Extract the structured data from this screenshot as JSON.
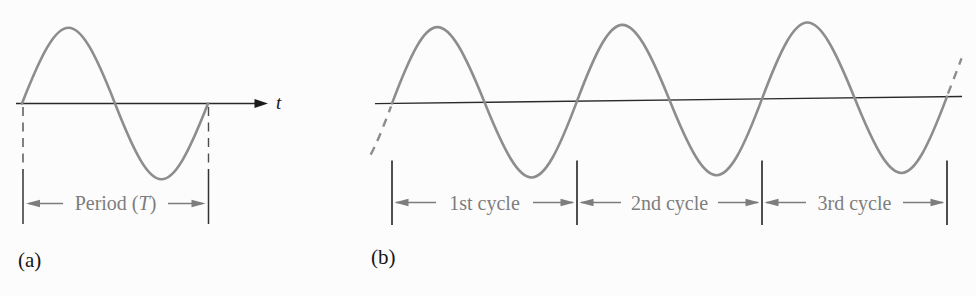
{
  "figure": {
    "panel_a": {
      "tag": "(a)",
      "axis_label": "t",
      "period_label": {
        "prefix": "Period (",
        "symbol": "T",
        "suffix": ")"
      },
      "cycles_shown": 1
    },
    "panel_b": {
      "tag": "(b)",
      "cycle_labels": [
        "1st cycle",
        "2nd cycle",
        "3rd cycle"
      ],
      "cycles_shown": 3
    },
    "colors": {
      "waveform": "#8d8d8d",
      "axis": "#2a2a2a",
      "dashed_guide": "#4d4d4d",
      "annotation": "#7d7d7d",
      "text": "#161616",
      "background": "#fcfcfc"
    }
  }
}
